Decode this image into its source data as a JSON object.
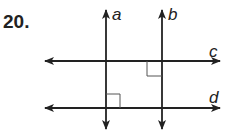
{
  "problem": {
    "number": "20."
  },
  "diagram": {
    "line_color": "#222222",
    "right_angle_color": "#555555",
    "lines": [
      {
        "id": "a",
        "orientation": "vertical",
        "label": "a"
      },
      {
        "id": "b",
        "orientation": "vertical",
        "label": "b"
      },
      {
        "id": "c",
        "orientation": "horizontal",
        "label": "c"
      },
      {
        "id": "d",
        "orientation": "horizontal",
        "label": "d"
      }
    ],
    "right_angle_marks": [
      {
        "at": "b-c",
        "position": "lower-left"
      },
      {
        "at": "a-d",
        "position": "upper-right"
      }
    ]
  }
}
